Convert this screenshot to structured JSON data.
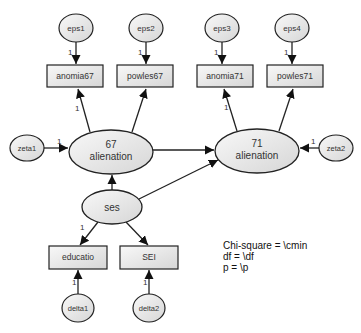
{
  "diagram": {
    "type": "structural-equation-model",
    "colors": {
      "node_fill_light": "#f7f7f7",
      "node_fill_dark": "#dcdcdc",
      "stroke": "#222222",
      "text": "#333333"
    },
    "error_terms": {
      "eps1": "eps1",
      "eps2": "eps2",
      "eps3": "eps3",
      "eps4": "eps4",
      "zeta1": "zeta1",
      "zeta2": "zeta2",
      "delta1": "delta1",
      "delta2": "delta2"
    },
    "observed": {
      "anomia67": "anomia67",
      "powles67": "powles67",
      "anomia71": "anomia71",
      "powles71": "powles71",
      "educatio": "educatio",
      "sei": "SEI"
    },
    "latent": {
      "alienation67_line1": "67",
      "alienation67_line2": "alienation",
      "alienation71_line1": "71",
      "alienation71_line2": "alienation",
      "ses": "ses"
    },
    "path_labels": {
      "eps1_anomia67": "1",
      "eps2_powles67": "1",
      "eps3_anomia71": "1",
      "eps4_powles71": "1",
      "alien67_anomia67": "1",
      "alien71_anomia71": "1",
      "zeta1_alien67": "1",
      "zeta2_alien71": "1",
      "ses_educatio": "1",
      "delta1_educatio": "1",
      "delta2_sei": "1"
    },
    "fit_stats": {
      "chi_square": "Chi-square = \\cmin",
      "df": "df = \\df",
      "p": "p = \\p"
    }
  }
}
